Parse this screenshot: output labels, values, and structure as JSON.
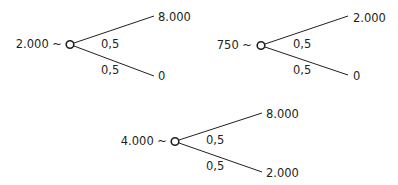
{
  "diagram": {
    "type": "lottery-trees",
    "colors": {
      "ink": "#231f20",
      "background": "#ffffff"
    },
    "trees": [
      {
        "id": "tree-1",
        "certainty_equivalent": "2.000 ~",
        "upper": {
          "probability": "0,5",
          "outcome": "8.000"
        },
        "lower": {
          "probability": "0,5",
          "outcome": "0"
        }
      },
      {
        "id": "tree-2",
        "certainty_equivalent": "750 ~",
        "upper": {
          "probability": "0,5",
          "outcome": "2.000"
        },
        "lower": {
          "probability": "0,5",
          "outcome": "0"
        }
      },
      {
        "id": "tree-3",
        "certainty_equivalent": "4.000 ~",
        "upper": {
          "probability": "0,5",
          "outcome": "8.000"
        },
        "lower": {
          "probability": "0,5",
          "outcome": "2.000"
        }
      }
    ]
  }
}
